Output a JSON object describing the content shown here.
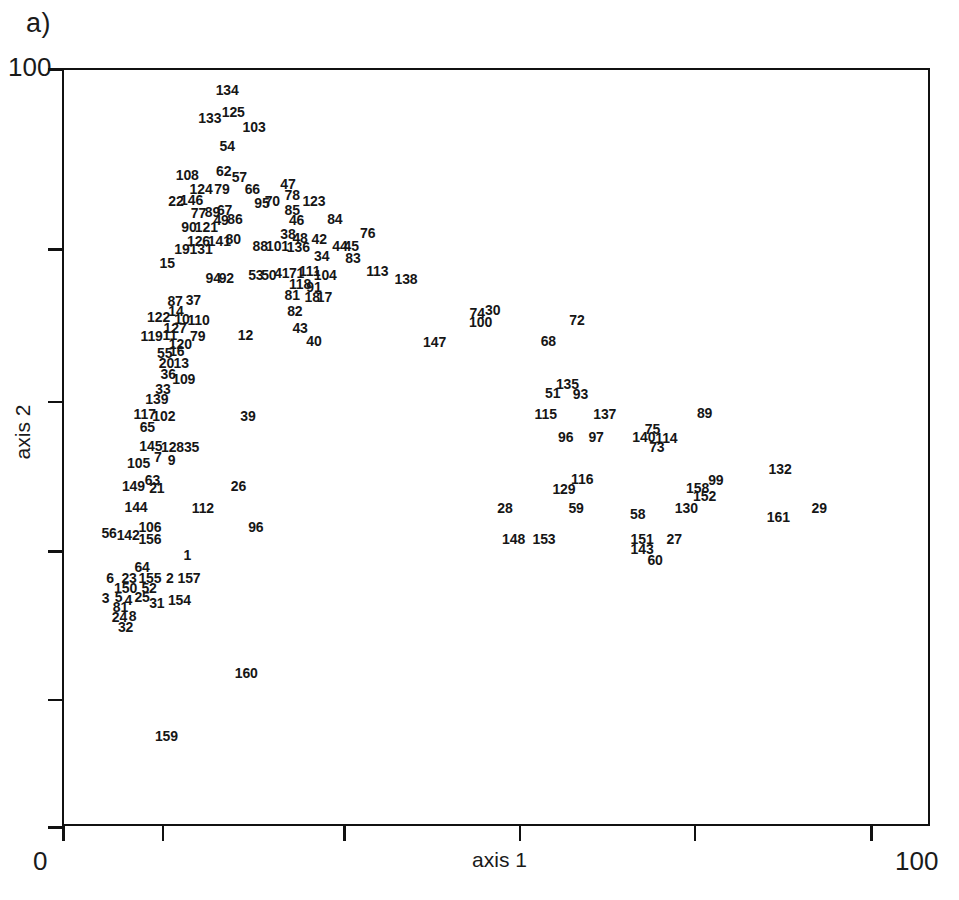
{
  "panel": {
    "label": "a)"
  },
  "chart_data": {
    "type": "scatter",
    "title": "a)",
    "xlabel": "axis 1",
    "ylabel": "axis 2",
    "xlim": [
      0,
      100
    ],
    "ylim": [
      0,
      100
    ],
    "grid": false,
    "legend": null,
    "note": "Ordination diagram; each point is rendered as its sample-number label only (no marker symbol).",
    "x_ticks": [
      0,
      11.5,
      32.4,
      52.6,
      72.8,
      93.1
    ],
    "x_tick_labels": [
      "0",
      "",
      "",
      "",
      "",
      ""
    ],
    "y_ticks": [
      100,
      76.2,
      56.1,
      36.4,
      16.8,
      0
    ],
    "y_tick_labels": [
      "100",
      "",
      "",
      "",
      "",
      "0"
    ],
    "point_label_key": "sample id",
    "points": [
      {
        "label": "134",
        "x": 18.8,
        "y": 97.4
      },
      {
        "label": "133",
        "x": 16.8,
        "y": 93.7
      },
      {
        "label": "125",
        "x": 19.5,
        "y": 94.5
      },
      {
        "label": "103",
        "x": 21.9,
        "y": 92.5
      },
      {
        "label": "54",
        "x": 18.8,
        "y": 90.0
      },
      {
        "label": "108",
        "x": 14.2,
        "y": 86.2
      },
      {
        "label": "62",
        "x": 18.4,
        "y": 86.7
      },
      {
        "label": "57",
        "x": 20.2,
        "y": 85.9
      },
      {
        "label": "124",
        "x": 15.8,
        "y": 84.3
      },
      {
        "label": "79",
        "x": 18.2,
        "y": 84.3
      },
      {
        "label": "66",
        "x": 21.7,
        "y": 84.3
      },
      {
        "label": "47",
        "x": 25.8,
        "y": 85.0
      },
      {
        "label": "22",
        "x": 12.9,
        "y": 82.7
      },
      {
        "label": "146",
        "x": 14.7,
        "y": 82.9
      },
      {
        "label": "95",
        "x": 22.8,
        "y": 82.5
      },
      {
        "label": "70",
        "x": 24.0,
        "y": 82.7
      },
      {
        "label": "78",
        "x": 26.3,
        "y": 83.5
      },
      {
        "label": "123",
        "x": 28.8,
        "y": 82.7
      },
      {
        "label": "85",
        "x": 26.3,
        "y": 81.5
      },
      {
        "label": "77",
        "x": 15.5,
        "y": 81.1
      },
      {
        "label": "89",
        "x": 17.1,
        "y": 81.3
      },
      {
        "label": "67",
        "x": 18.5,
        "y": 81.5
      },
      {
        "label": "49",
        "x": 18.1,
        "y": 80.2
      },
      {
        "label": "86",
        "x": 19.7,
        "y": 80.4
      },
      {
        "label": "46",
        "x": 26.8,
        "y": 80.2
      },
      {
        "label": "84",
        "x": 31.2,
        "y": 80.4
      },
      {
        "label": "90",
        "x": 14.4,
        "y": 79.3
      },
      {
        "label": "121",
        "x": 16.4,
        "y": 79.3
      },
      {
        "label": "38",
        "x": 25.8,
        "y": 78.3
      },
      {
        "label": "48",
        "x": 27.2,
        "y": 77.9
      },
      {
        "label": "42",
        "x": 29.4,
        "y": 77.7
      },
      {
        "label": "76",
        "x": 35.0,
        "y": 78.5
      },
      {
        "label": "126",
        "x": 15.5,
        "y": 77.5
      },
      {
        "label": "141",
        "x": 17.9,
        "y": 77.5
      },
      {
        "label": "80",
        "x": 19.5,
        "y": 77.7
      },
      {
        "label": "88",
        "x": 22.6,
        "y": 76.8
      },
      {
        "label": "101",
        "x": 24.6,
        "y": 76.8
      },
      {
        "label": "136",
        "x": 27.0,
        "y": 76.6
      },
      {
        "label": "44",
        "x": 31.8,
        "y": 76.8
      },
      {
        "label": "45",
        "x": 33.1,
        "y": 76.8
      },
      {
        "label": "19",
        "x": 13.6,
        "y": 76.4
      },
      {
        "label": "131",
        "x": 15.8,
        "y": 76.4
      },
      {
        "label": "34",
        "x": 29.7,
        "y": 75.4
      },
      {
        "label": "83",
        "x": 33.3,
        "y": 75.2
      },
      {
        "label": "15",
        "x": 11.9,
        "y": 74.6
      },
      {
        "label": "113",
        "x": 36.1,
        "y": 73.5
      },
      {
        "label": "53",
        "x": 22.1,
        "y": 73.0
      },
      {
        "label": "50",
        "x": 23.6,
        "y": 73.0
      },
      {
        "label": "41",
        "x": 25.1,
        "y": 73.2
      },
      {
        "label": "71",
        "x": 26.8,
        "y": 73.2
      },
      {
        "label": "111",
        "x": 28.3,
        "y": 73.5
      },
      {
        "label": "104",
        "x": 30.1,
        "y": 73.0
      },
      {
        "label": "94",
        "x": 17.2,
        "y": 72.6
      },
      {
        "label": "92",
        "x": 18.7,
        "y": 72.6
      },
      {
        "label": "138",
        "x": 39.4,
        "y": 72.4
      },
      {
        "label": "118",
        "x": 27.2,
        "y": 71.8
      },
      {
        "label": "91",
        "x": 28.8,
        "y": 71.4
      },
      {
        "label": "81",
        "x": 26.3,
        "y": 70.3
      },
      {
        "label": "18",
        "x": 28.6,
        "y": 70.1
      },
      {
        "label": "17",
        "x": 30.0,
        "y": 70.1
      },
      {
        "label": "87",
        "x": 12.8,
        "y": 69.5
      },
      {
        "label": "37",
        "x": 14.9,
        "y": 69.7
      },
      {
        "label": "14",
        "x": 12.9,
        "y": 68.2
      },
      {
        "label": "82",
        "x": 26.6,
        "y": 68.2
      },
      {
        "label": "74",
        "x": 47.6,
        "y": 68.0
      },
      {
        "label": "30",
        "x": 49.4,
        "y": 68.4
      },
      {
        "label": "122",
        "x": 10.9,
        "y": 67.4
      },
      {
        "label": "10",
        "x": 13.6,
        "y": 67.2
      },
      {
        "label": "110",
        "x": 15.5,
        "y": 67.0
      },
      {
        "label": "100",
        "x": 48.0,
        "y": 66.8
      },
      {
        "label": "72",
        "x": 59.1,
        "y": 67.0
      },
      {
        "label": "127",
        "x": 12.8,
        "y": 66.0
      },
      {
        "label": "43",
        "x": 27.2,
        "y": 66.0
      },
      {
        "label": "119",
        "x": 10.1,
        "y": 64.9
      },
      {
        "label": "11",
        "x": 12.2,
        "y": 65.1
      },
      {
        "label": "79",
        "x": 15.4,
        "y": 64.9
      },
      {
        "label": "12",
        "x": 20.9,
        "y": 65.1
      },
      {
        "label": "120",
        "x": 13.4,
        "y": 63.9
      },
      {
        "label": "40",
        "x": 28.8,
        "y": 64.3
      },
      {
        "label": "147",
        "x": 42.7,
        "y": 64.1
      },
      {
        "label": "68",
        "x": 55.8,
        "y": 64.3
      },
      {
        "label": "55",
        "x": 11.6,
        "y": 62.7
      },
      {
        "label": "16",
        "x": 13.0,
        "y": 62.9
      },
      {
        "label": "20",
        "x": 11.8,
        "y": 61.3
      },
      {
        "label": "13",
        "x": 13.5,
        "y": 61.3
      },
      {
        "label": "36",
        "x": 12.0,
        "y": 59.9
      },
      {
        "label": "109",
        "x": 13.8,
        "y": 59.3
      },
      {
        "label": "135",
        "x": 58.0,
        "y": 58.6
      },
      {
        "label": "33",
        "x": 11.4,
        "y": 57.9
      },
      {
        "label": "51",
        "x": 56.3,
        "y": 57.4
      },
      {
        "label": "93",
        "x": 59.5,
        "y": 57.2
      },
      {
        "label": "139",
        "x": 10.7,
        "y": 56.6
      },
      {
        "label": "117",
        "x": 9.3,
        "y": 54.6
      },
      {
        "label": "102",
        "x": 11.5,
        "y": 54.4
      },
      {
        "label": "115",
        "x": 55.5,
        "y": 54.6
      },
      {
        "label": "137",
        "x": 62.3,
        "y": 54.6
      },
      {
        "label": "89",
        "x": 73.8,
        "y": 54.8
      },
      {
        "label": "65",
        "x": 9.6,
        "y": 52.9
      },
      {
        "label": "75",
        "x": 67.8,
        "y": 52.7
      },
      {
        "label": "96",
        "x": 57.8,
        "y": 51.6
      },
      {
        "label": "97",
        "x": 61.3,
        "y": 51.6
      },
      {
        "label": "140",
        "x": 66.8,
        "y": 51.6
      },
      {
        "label": "114",
        "x": 69.4,
        "y": 51.4
      },
      {
        "label": "145",
        "x": 10.0,
        "y": 50.4
      },
      {
        "label": "128",
        "x": 12.5,
        "y": 50.2
      },
      {
        "label": "35",
        "x": 14.7,
        "y": 50.2
      },
      {
        "label": "73",
        "x": 68.3,
        "y": 50.2
      },
      {
        "label": "7",
        "x": 10.8,
        "y": 49.0
      },
      {
        "label": "9",
        "x": 12.4,
        "y": 48.6
      },
      {
        "label": "105",
        "x": 8.6,
        "y": 48.2
      },
      {
        "label": "132",
        "x": 82.5,
        "y": 47.4
      },
      {
        "label": "63",
        "x": 10.2,
        "y": 45.9
      },
      {
        "label": "116",
        "x": 59.7,
        "y": 46.1
      },
      {
        "label": "99",
        "x": 75.1,
        "y": 45.9
      },
      {
        "label": "149",
        "x": 8.0,
        "y": 45.1
      },
      {
        "label": "21",
        "x": 10.7,
        "y": 44.9
      },
      {
        "label": "26",
        "x": 20.1,
        "y": 45.1
      },
      {
        "label": "129",
        "x": 57.6,
        "y": 44.7
      },
      {
        "label": "158",
        "x": 73.0,
        "y": 44.9
      },
      {
        "label": "152",
        "x": 73.8,
        "y": 43.8
      },
      {
        "label": "144",
        "x": 8.3,
        "y": 42.4
      },
      {
        "label": "112",
        "x": 16.0,
        "y": 42.2
      },
      {
        "label": "28",
        "x": 50.8,
        "y": 42.2
      },
      {
        "label": "59",
        "x": 59.0,
        "y": 42.2
      },
      {
        "label": "58",
        "x": 66.1,
        "y": 41.4
      },
      {
        "label": "130",
        "x": 71.7,
        "y": 42.2
      },
      {
        "label": "29",
        "x": 87.0,
        "y": 42.2
      },
      {
        "label": "161",
        "x": 82.3,
        "y": 41.0
      },
      {
        "label": "56",
        "x": 5.2,
        "y": 38.9
      },
      {
        "label": "142",
        "x": 7.4,
        "y": 38.7
      },
      {
        "label": "106",
        "x": 9.9,
        "y": 39.7
      },
      {
        "label": "156",
        "x": 9.9,
        "y": 38.1
      },
      {
        "label": "148",
        "x": 51.8,
        "y": 38.1
      },
      {
        "label": "153",
        "x": 55.3,
        "y": 38.1
      },
      {
        "label": "151",
        "x": 66.6,
        "y": 38.1
      },
      {
        "label": "27",
        "x": 70.3,
        "y": 38.1
      },
      {
        "label": "143",
        "x": 66.6,
        "y": 36.8
      },
      {
        "label": "1",
        "x": 14.2,
        "y": 36.0
      },
      {
        "label": "60",
        "x": 68.1,
        "y": 35.4
      },
      {
        "label": "64",
        "x": 9.0,
        "y": 34.4
      },
      {
        "label": "6",
        "x": 5.3,
        "y": 33.0
      },
      {
        "label": "23",
        "x": 7.5,
        "y": 33.0
      },
      {
        "label": "155",
        "x": 9.9,
        "y": 33.0
      },
      {
        "label": "2",
        "x": 12.2,
        "y": 33.0
      },
      {
        "label": "157",
        "x": 14.4,
        "y": 33.0
      },
      {
        "label": "150",
        "x": 7.1,
        "y": 31.6
      },
      {
        "label": "52",
        "x": 9.8,
        "y": 31.6
      },
      {
        "label": "3",
        "x": 4.8,
        "y": 30.3
      },
      {
        "label": "5",
        "x": 6.3,
        "y": 30.5
      },
      {
        "label": "4",
        "x": 7.4,
        "y": 30.1
      },
      {
        "label": "25",
        "x": 9.0,
        "y": 30.5
      },
      {
        "label": "31",
        "x": 10.7,
        "y": 29.7
      },
      {
        "label": "154",
        "x": 13.3,
        "y": 30.1
      },
      {
        "label": "81",
        "x": 6.5,
        "y": 29.1
      },
      {
        "label": "24",
        "x": 6.4,
        "y": 27.8
      },
      {
        "label": "8",
        "x": 7.9,
        "y": 28.0
      },
      {
        "label": "32",
        "x": 7.1,
        "y": 26.5
      },
      {
        "label": "96",
        "x": 22.1,
        "y": 39.7
      },
      {
        "label": "39",
        "x": 21.2,
        "y": 54.4
      },
      {
        "label": "160",
        "x": 21.0,
        "y": 20.5
      },
      {
        "label": "159",
        "x": 11.8,
        "y": 12.1
      }
    ]
  },
  "axes": {
    "x_title": "axis 1",
    "y_title": "axis 2",
    "x_min_label": "0",
    "x_max_label": "100",
    "y_min_label": "0",
    "y_max_label": "100"
  }
}
